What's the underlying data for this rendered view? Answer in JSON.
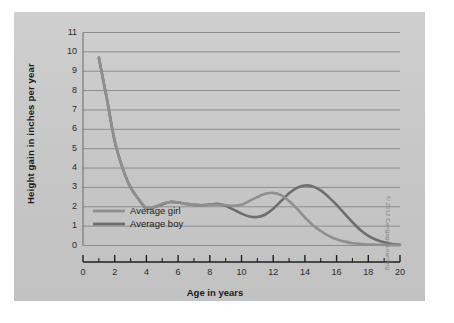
{
  "figure": {
    "panel_bg": "#c9c9c9",
    "page_bg": "#ffffff",
    "credit": "© 2012 Cengage Learning"
  },
  "chart_data": {
    "type": "line",
    "title": "",
    "xlabel": "Age in years",
    "ylabel": "Height gain in inches per year",
    "xlim": [
      0,
      20
    ],
    "ylim": [
      0,
      11
    ],
    "grid": true,
    "grid_axis": "y",
    "legend_position": "inside-lower-left",
    "x_ticks": [
      0,
      2,
      4,
      6,
      8,
      10,
      12,
      14,
      16,
      18,
      20
    ],
    "x_minor_ticks": [
      1,
      3,
      5,
      7,
      9,
      11,
      13,
      15,
      17,
      19
    ],
    "y_ticks": [
      0,
      1,
      2,
      3,
      4,
      5,
      6,
      7,
      8,
      9,
      10,
      11
    ],
    "x_tick_labels": [
      "0",
      "2",
      "4",
      "6",
      "8",
      "10",
      "12",
      "14",
      "16",
      "18",
      "20"
    ],
    "y_tick_labels": [
      "0",
      "1",
      "2",
      "3",
      "4",
      "5",
      "6",
      "7",
      "8",
      "9",
      "10",
      "11"
    ],
    "x": [
      1,
      1.5,
      2,
      2.5,
      3,
      3.5,
      4,
      4.5,
      5,
      5.5,
      6,
      6.5,
      7,
      7.5,
      8,
      8.5,
      9,
      9.5,
      10,
      10.5,
      11,
      11.5,
      12,
      12.5,
      13,
      13.5,
      14,
      14.5,
      15,
      15.5,
      16,
      16.5,
      17,
      17.5,
      18,
      18.5,
      19,
      19.5,
      20
    ],
    "series": [
      {
        "name": "Average girl",
        "color": "#8f8f8f",
        "values": [
          9.7,
          7.6,
          5.4,
          4.0,
          3.0,
          2.4,
          1.95,
          2.0,
          2.15,
          2.25,
          2.22,
          2.15,
          2.1,
          2.08,
          2.1,
          2.12,
          2.08,
          2.05,
          2.1,
          2.3,
          2.5,
          2.67,
          2.72,
          2.6,
          2.3,
          1.9,
          1.45,
          1.05,
          0.75,
          0.5,
          0.32,
          0.2,
          0.12,
          0.08,
          0.05,
          0.04,
          0.03,
          0.02,
          0.02
        ]
      },
      {
        "name": "Average boy",
        "color": "#6e6e6e",
        "values": [
          9.7,
          7.6,
          5.4,
          4.0,
          3.0,
          2.4,
          1.92,
          1.98,
          2.12,
          2.25,
          2.22,
          2.15,
          2.1,
          2.08,
          2.12,
          2.15,
          2.05,
          1.85,
          1.65,
          1.5,
          1.47,
          1.6,
          1.9,
          2.3,
          2.7,
          2.98,
          3.1,
          3.05,
          2.85,
          2.5,
          2.1,
          1.65,
          1.2,
          0.8,
          0.5,
          0.3,
          0.17,
          0.08,
          0.04
        ]
      }
    ],
    "legend": [
      {
        "label": "Average girl",
        "color": "#8f8f8f"
      },
      {
        "label": "Average boy",
        "color": "#6e6e6e"
      }
    ]
  }
}
